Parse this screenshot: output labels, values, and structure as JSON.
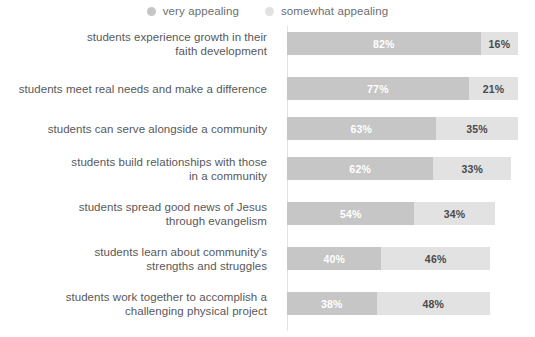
{
  "legend": {
    "position": "top-center",
    "items": [
      {
        "label": "very appealing",
        "color": "#c6c6c6",
        "marker": "circle-marker-icon"
      },
      {
        "label": "somewhat appealing",
        "color": "#e2e2e2",
        "marker": "circle-marker-icon"
      }
    ]
  },
  "chart_data": {
    "type": "bar",
    "orientation": "horizontal",
    "stacked": true,
    "title": "",
    "subtitle": "",
    "xlabel": "",
    "ylabel": "",
    "xlim": [
      0,
      100
    ],
    "grid": false,
    "legend_position": "top-center",
    "value_suffix": "%",
    "categories": [
      "students experience growth in their\nfaith development",
      "students meet real needs and make a difference",
      "students can serve alongside a community",
      "students build relationships with those\nin a community",
      "students spread good news of Jesus\nthrough evangelism",
      "students learn about community's\nstrengths and struggles",
      "students work together to accomplish a\nchallenging physical project"
    ],
    "series": [
      {
        "name": "very appealing",
        "color": "#c6c6c6",
        "values": [
          82,
          77,
          63,
          62,
          54,
          40,
          38
        ]
      },
      {
        "name": "somewhat appealing",
        "color": "#e2e2e2",
        "values": [
          16,
          21,
          35,
          33,
          34,
          46,
          48
        ]
      }
    ]
  },
  "rows": [
    {
      "label": "students experience growth in their\nfaith development",
      "primary_value": "82%",
      "secondary_value": "16%",
      "primary_pct": 82,
      "secondary_pct": 16
    },
    {
      "label": "students meet real needs and make a difference",
      "primary_value": "77%",
      "secondary_value": "21%",
      "primary_pct": 77,
      "secondary_pct": 21
    },
    {
      "label": "students can serve alongside a community",
      "primary_value": "63%",
      "secondary_value": "35%",
      "primary_pct": 63,
      "secondary_pct": 35
    },
    {
      "label": "students build relationships with those\nin a community",
      "primary_value": "62%",
      "secondary_value": "33%",
      "primary_pct": 62,
      "secondary_pct": 33
    },
    {
      "label": "students spread good news of Jesus\nthrough evangelism",
      "primary_value": "54%",
      "secondary_value": "34%",
      "primary_pct": 54,
      "secondary_pct": 34
    },
    {
      "label": "students learn about community's\nstrengths and struggles",
      "primary_value": "40%",
      "secondary_value": "46%",
      "primary_pct": 40,
      "secondary_pct": 46
    },
    {
      "label": "students work together to accomplish a\nchallenging physical project",
      "primary_value": "38%",
      "secondary_value": "48%",
      "primary_pct": 38,
      "secondary_pct": 48
    }
  ]
}
